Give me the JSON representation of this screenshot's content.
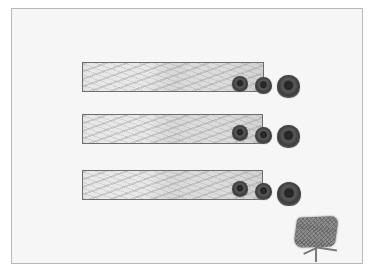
{
  "diagram": {
    "type": "garden-layout",
    "colors": {
      "background": "#ffffff",
      "frame_fill": "#f6f6f6",
      "frame_border": "#b8b8b8",
      "bar_fill": "#d4d4d4",
      "bar_border": "#6e6e6e",
      "rock_dark": "#2a2a2a",
      "plant_fill": "#8e8e8e"
    },
    "rows": [
      {
        "id": "row-1",
        "bar": {
          "x": 82,
          "y": 62,
          "w": 182,
          "h": 30
        },
        "rocks": [
          {
            "size": "small",
            "x": 232,
            "y": 76,
            "d": 16
          },
          {
            "size": "medium",
            "x": 255,
            "y": 77,
            "d": 17
          },
          {
            "size": "large",
            "x": 277,
            "y": 75,
            "d": 23
          }
        ]
      },
      {
        "id": "row-2",
        "bar": {
          "x": 82,
          "y": 114,
          "w": 181,
          "h": 30
        },
        "rocks": [
          {
            "size": "small",
            "x": 232,
            "y": 125,
            "d": 16
          },
          {
            "size": "medium",
            "x": 255,
            "y": 127,
            "d": 17
          },
          {
            "size": "large",
            "x": 277,
            "y": 125,
            "d": 23
          }
        ]
      },
      {
        "id": "row-3",
        "bar": {
          "x": 82,
          "y": 170,
          "w": 181,
          "h": 30
        },
        "rocks": [
          {
            "size": "small",
            "x": 232,
            "y": 181,
            "d": 16
          },
          {
            "size": "medium",
            "x": 255,
            "y": 183,
            "d": 17
          },
          {
            "size": "large",
            "x": 277,
            "y": 182,
            "d": 24
          }
        ]
      }
    ],
    "plant": {
      "x": 293,
      "y": 214,
      "w": 54,
      "h": 50
    }
  }
}
